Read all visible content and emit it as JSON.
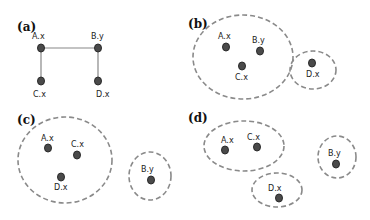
{
  "colors": {
    "node": "#4a4a4a",
    "edge": "#888888",
    "cluster": "#8a8a8a"
  },
  "panels": {
    "a": {
      "label": "(a)",
      "nodes": [
        {
          "id": "A.x",
          "label": "A.x"
        },
        {
          "id": "B.y",
          "label": "B.y"
        },
        {
          "id": "C.x",
          "label": "C.x"
        },
        {
          "id": "D.x",
          "label": "D.x"
        }
      ],
      "edges": [
        [
          "A.x",
          "B.y"
        ],
        [
          "A.x",
          "C.x"
        ],
        [
          "B.y",
          "D.x"
        ]
      ]
    },
    "b": {
      "label": "(b)",
      "nodes": [
        {
          "id": "A.x",
          "label": "A.x"
        },
        {
          "id": "B.y",
          "label": "B.y"
        },
        {
          "id": "C.x",
          "label": "C.x"
        },
        {
          "id": "D.x",
          "label": "D.x"
        }
      ],
      "clusters": [
        [
          "A.x",
          "B.y",
          "C.x"
        ],
        [
          "D.x"
        ]
      ]
    },
    "c": {
      "label": "(c)",
      "nodes": [
        {
          "id": "A.x",
          "label": "A.x"
        },
        {
          "id": "C.x",
          "label": "C.x"
        },
        {
          "id": "D.x",
          "label": "D.x"
        },
        {
          "id": "B.y",
          "label": "B.y"
        }
      ],
      "clusters": [
        [
          "A.x",
          "C.x",
          "D.x"
        ],
        [
          "B.y"
        ]
      ]
    },
    "d": {
      "label": "(d)",
      "nodes": [
        {
          "id": "A.x",
          "label": "A.x"
        },
        {
          "id": "C.x",
          "label": "C.x"
        },
        {
          "id": "B.y",
          "label": "B.y"
        },
        {
          "id": "D.x",
          "label": "D.x"
        }
      ],
      "clusters": [
        [
          "A.x",
          "C.x"
        ],
        [
          "B.y"
        ],
        [
          "D.x"
        ]
      ]
    }
  }
}
